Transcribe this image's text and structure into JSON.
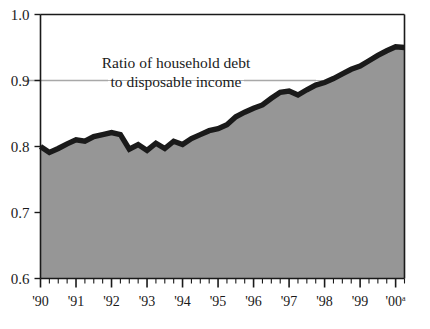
{
  "chart_data": {
    "type": "area",
    "title": "",
    "annotation": {
      "line1": "Ratio of household debt",
      "line2": "to disposable income",
      "leader_level": 0.9
    },
    "xlabel": "",
    "ylabel": "",
    "ylim": [
      0.6,
      1.0
    ],
    "xlim": [
      1990.0,
      2000.25
    ],
    "ytick_labels": [
      "1.0",
      "0.9",
      "0.8",
      "0.7",
      "0.6"
    ],
    "ytick_values": [
      1.0,
      0.9,
      0.8,
      0.7,
      0.6
    ],
    "xtick_labels": [
      "'90",
      "'91",
      "'92",
      "'93",
      "'94",
      "'95",
      "'96",
      "'97",
      "'98",
      "'99",
      "'00"
    ],
    "xtick_values": [
      1990,
      1991,
      1992,
      1993,
      1994,
      1995,
      1996,
      1997,
      1998,
      1999,
      2000
    ],
    "xtick_last_superscript": "a",
    "grid": "single-gridline-at-0.9",
    "legend": "none",
    "minor_ticks_per_year": 4,
    "colors": {
      "line": "#1a1a1a",
      "fill": "#969696",
      "axis": "#1a1a1a",
      "gridline": "#b0b0b0",
      "leader": "#a8a8a8",
      "background": "#ffffff"
    },
    "series": [
      {
        "name": "Ratio of household debt to disposable income",
        "x": [
          1990.0,
          1990.25,
          1990.5,
          1990.75,
          1991.0,
          1991.25,
          1991.5,
          1991.75,
          1992.0,
          1992.25,
          1992.5,
          1992.75,
          1993.0,
          1993.25,
          1993.5,
          1993.75,
          1994.0,
          1994.25,
          1994.5,
          1994.75,
          1995.0,
          1995.25,
          1995.5,
          1995.75,
          1996.0,
          1996.25,
          1996.5,
          1996.75,
          1997.0,
          1997.25,
          1997.5,
          1997.75,
          1998.0,
          1998.25,
          1998.5,
          1998.75,
          1999.0,
          1999.25,
          1999.5,
          1999.75,
          2000.0,
          2000.25
        ],
        "values": [
          0.8,
          0.791,
          0.797,
          0.804,
          0.81,
          0.808,
          0.815,
          0.818,
          0.821,
          0.818,
          0.796,
          0.803,
          0.794,
          0.805,
          0.797,
          0.808,
          0.803,
          0.812,
          0.818,
          0.824,
          0.827,
          0.833,
          0.845,
          0.852,
          0.858,
          0.863,
          0.873,
          0.882,
          0.884,
          0.878,
          0.886,
          0.893,
          0.897,
          0.903,
          0.91,
          0.917,
          0.922,
          0.93,
          0.938,
          0.945,
          0.951,
          0.95
        ]
      }
    ]
  }
}
